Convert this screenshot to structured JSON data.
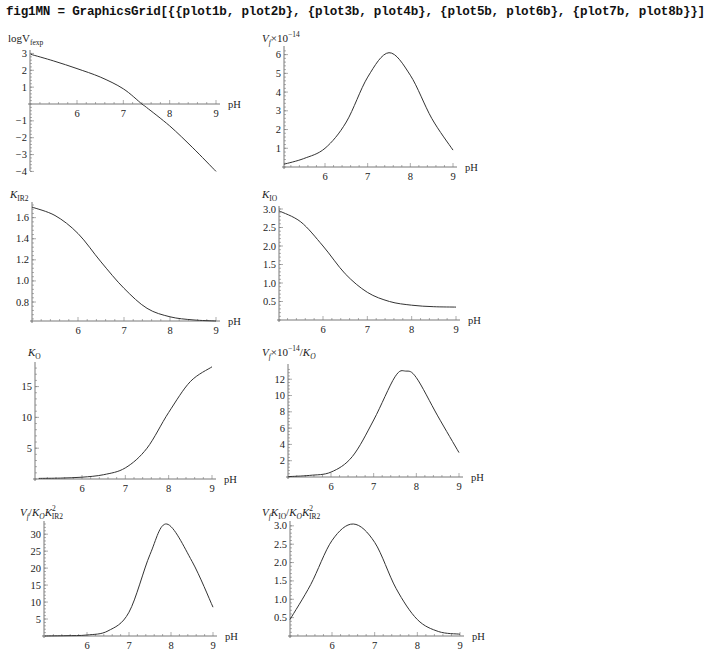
{
  "header": {
    "code": "fig1MN = GraphicsGrid[{{plot1b, plot2b}, {plot3b, plot4b}, {plot5b, plot6b}, {plot7b, plot8b}}]"
  },
  "chart_data": [
    {
      "id": "plot1b",
      "type": "line",
      "ylabel": "logV_fexp",
      "xlabel": "pH",
      "xlim": [
        5,
        9
      ],
      "ylim": [
        -4,
        3
      ],
      "xticks": [
        "6",
        "7",
        "8",
        "9"
      ],
      "yticks": [
        "3",
        "2",
        "1",
        "-1",
        "-2",
        "-3",
        "-4"
      ],
      "x": [
        5,
        5.5,
        6,
        6.5,
        7,
        7.4,
        7.5,
        8,
        8.5,
        9
      ],
      "y": [
        2.95,
        2.55,
        2.1,
        1.6,
        0.9,
        0.0,
        -0.2,
        -1.3,
        -2.6,
        -4.0
      ]
    },
    {
      "id": "plot2b",
      "type": "line",
      "ylabel": "V_f×10^-14",
      "xlabel": "pH",
      "xlim": [
        5,
        9
      ],
      "ylim": [
        0,
        6.3
      ],
      "xticks": [
        "6",
        "7",
        "8",
        "9"
      ],
      "yticks": [
        "1",
        "2",
        "3",
        "4",
        "5",
        "6"
      ],
      "x": [
        5,
        5.5,
        6,
        6.5,
        7,
        7.5,
        8,
        8.5,
        9
      ],
      "y": [
        0.15,
        0.45,
        1.0,
        2.4,
        4.8,
        6.1,
        4.9,
        2.6,
        0.9
      ]
    },
    {
      "id": "plot3b",
      "type": "line",
      "ylabel": "K_IR2",
      "xlabel": "pH",
      "xlim": [
        5,
        9
      ],
      "ylim": [
        0.62,
        1.72
      ],
      "xticks": [
        "6",
        "7",
        "8",
        "9"
      ],
      "yticks": [
        "0.8",
        "1.0",
        "1.2",
        "1.4",
        "1.6"
      ],
      "x": [
        5,
        5.5,
        6,
        6.5,
        7,
        7.5,
        8,
        8.5,
        9
      ],
      "y": [
        1.7,
        1.62,
        1.45,
        1.18,
        0.93,
        0.74,
        0.66,
        0.63,
        0.62
      ]
    },
    {
      "id": "plot4b",
      "type": "line",
      "ylabel": "K_IO",
      "xlabel": "pH",
      "xlim": [
        5,
        9
      ],
      "ylim": [
        0,
        3.0
      ],
      "xticks": [
        "6",
        "7",
        "8",
        "9"
      ],
      "yticks": [
        "0.5",
        "1.0",
        "1.5",
        "2.0",
        "2.5",
        "3.0"
      ],
      "x": [
        5,
        5.5,
        6,
        6.5,
        7,
        7.5,
        8,
        8.5,
        9
      ],
      "y": [
        2.95,
        2.65,
        2.0,
        1.25,
        0.75,
        0.5,
        0.4,
        0.36,
        0.35
      ]
    },
    {
      "id": "plot5b",
      "type": "line",
      "ylabel": "K_O",
      "xlabel": "pH",
      "xlim": [
        5,
        9
      ],
      "ylim": [
        0,
        18.5
      ],
      "xticks": [
        "6",
        "7",
        "8",
        "9"
      ],
      "yticks": [
        "5",
        "10",
        "15"
      ],
      "x": [
        5,
        5.5,
        6,
        6.5,
        7,
        7.5,
        8,
        8.5,
        9
      ],
      "y": [
        0.1,
        0.15,
        0.3,
        0.7,
        1.8,
        5.0,
        10.8,
        15.8,
        18.2
      ]
    },
    {
      "id": "plot6b",
      "type": "line",
      "ylabel": "V_f×10^-14/K_O",
      "xlabel": "pH",
      "xlim": [
        5,
        9
      ],
      "ylim": [
        0,
        13.5
      ],
      "xticks": [
        "6",
        "7",
        "8",
        "9"
      ],
      "yticks": [
        "2",
        "4",
        "6",
        "8",
        "10",
        "12"
      ],
      "x": [
        5,
        5.5,
        6,
        6.5,
        7,
        7.5,
        7.75,
        8,
        8.5,
        9
      ],
      "y": [
        0.05,
        0.2,
        0.6,
        2.5,
        7.0,
        12.3,
        13.0,
        12.2,
        7.5,
        3.0
      ]
    },
    {
      "id": "plot7b",
      "type": "line",
      "ylabel": "V_f/K_O K_IR2^2",
      "xlabel": "pH",
      "xlim": [
        5,
        9
      ],
      "ylim": [
        0,
        33
      ],
      "xticks": [
        "6",
        "7",
        "8",
        "9"
      ],
      "yticks": [
        "5",
        "10",
        "15",
        "20",
        "25",
        "30"
      ],
      "x": [
        5,
        5.5,
        6,
        6.5,
        7,
        7.5,
        7.9,
        8.5,
        9
      ],
      "y": [
        0.0,
        0.1,
        0.3,
        1.5,
        7.0,
        24.0,
        33.0,
        22.0,
        8.5
      ]
    },
    {
      "id": "plot8b",
      "type": "line",
      "ylabel": "V_f K_IO/K_O K_IR2^2",
      "xlabel": "pH",
      "xlim": [
        5,
        9
      ],
      "ylim": [
        0,
        3.05
      ],
      "xticks": [
        "6",
        "7",
        "8",
        "9"
      ],
      "yticks": [
        "0.5",
        "1.0",
        "1.5",
        "2.0",
        "2.5",
        "3.0"
      ],
      "x": [
        5,
        5.5,
        6,
        6.5,
        7,
        7.5,
        8,
        8.5,
        9
      ],
      "y": [
        0.45,
        1.4,
        2.6,
        3.05,
        2.55,
        1.3,
        0.45,
        0.12,
        0.05
      ]
    }
  ],
  "labels": {
    "p1": {
      "main": "logV",
      "sub": "fexp"
    },
    "p2": {
      "main": "V",
      "sub": "f",
      "rest": "×10",
      "sup": "−14"
    },
    "p3": {
      "main": "K",
      "sub": "IR2"
    },
    "p4": {
      "main": "K",
      "sub": "IO"
    },
    "p5": {
      "main": "K",
      "sub": "O"
    },
    "p6": {
      "main": "V",
      "sub": "f",
      "rest": "×10",
      "sup": "−14",
      "rest2": "/K",
      "sub2": "O"
    },
    "p7": {
      "a": "V",
      "asub": "f",
      "b": "/K",
      "bsub": "O",
      "c": "K",
      "csup": "2",
      "csub": "IR2"
    },
    "p8": {
      "a": "V",
      "asub": "f",
      "b": "K",
      "bsub": "IO",
      "c": "/K",
      "csub2": "O",
      "d": "K",
      "dsup": "2",
      "dsub": "IR2"
    },
    "xaxis": "pH"
  }
}
